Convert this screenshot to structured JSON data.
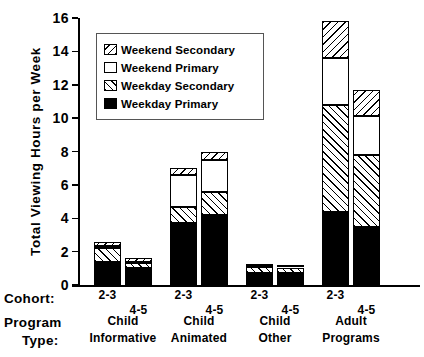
{
  "chart_data": {
    "type": "bar",
    "subtype": "stacked-grouped",
    "title": "",
    "xlabel": "",
    "ylabel": "Total Viewing Hours per Week",
    "ylim": [
      0,
      16
    ],
    "ytick_step": 2,
    "yticks": [
      "0",
      "2",
      "4",
      "6",
      "8",
      "10",
      "12",
      "14",
      "16"
    ],
    "grid": false,
    "legend_position": "upper-left-inside",
    "axis_row_labels": {
      "cohort_header": "Cohort:",
      "program_header_line1": "Program",
      "program_header_line2": "Type:"
    },
    "groups": [
      {
        "group_label_line1": "Child",
        "group_label_line2": "Informative",
        "bars": [
          {
            "cohort": "2-3",
            "total": 2.6,
            "segments": {
              "Weekday Primary": 1.4,
              "Weekday Secondary": 0.8,
              "Weekend Primary": 0.15,
              "Weekend Secondary": 0.25
            }
          },
          {
            "cohort": "4-5",
            "total": 1.6,
            "segments": {
              "Weekday Primary": 1.0,
              "Weekday Secondary": 0.3,
              "Weekend Primary": 0.1,
              "Weekend Secondary": 0.2
            }
          }
        ]
      },
      {
        "group_label_line1": "Child",
        "group_label_line2": "Animated",
        "bars": [
          {
            "cohort": "2-3",
            "total": 7.0,
            "segments": {
              "Weekday Primary": 3.7,
              "Weekday Secondary": 1.0,
              "Weekend Primary": 1.9,
              "Weekend Secondary": 0.4
            }
          },
          {
            "cohort": "4-5",
            "total": 8.0,
            "segments": {
              "Weekday Primary": 4.2,
              "Weekday Secondary": 1.4,
              "Weekend Primary": 1.9,
              "Weekend Secondary": 0.5
            }
          }
        ]
      },
      {
        "group_label_line1": "Child",
        "group_label_line2": "Other",
        "bars": [
          {
            "cohort": "2-3",
            "total": 1.2,
            "segments": {
              "Weekday Primary": 0.7,
              "Weekday Secondary": 0.4,
              "Weekend Primary": 0.05,
              "Weekend Secondary": 0.05
            }
          },
          {
            "cohort": "4-5",
            "total": 1.15,
            "segments": {
              "Weekday Primary": 0.7,
              "Weekday Secondary": 0.35,
              "Weekend Primary": 0.05,
              "Weekend Secondary": 0.05
            }
          }
        ]
      },
      {
        "group_label_line1": "Adult",
        "group_label_line2": "Programs",
        "bars": [
          {
            "cohort": "2-3",
            "total": 15.8,
            "segments": {
              "Weekday Primary": 4.4,
              "Weekday Secondary": 6.4,
              "Weekend Primary": 2.8,
              "Weekend Secondary": 2.2
            }
          },
          {
            "cohort": "4-5",
            "total": 11.7,
            "segments": {
              "Weekday Primary": 3.5,
              "Weekday Secondary": 4.3,
              "Weekend Primary": 2.3,
              "Weekend Secondary": 1.6
            }
          }
        ]
      }
    ],
    "legend": [
      {
        "label": "Weekend Secondary",
        "pattern": "backslash-hatch"
      },
      {
        "label": "Weekend Primary",
        "pattern": "solid-white"
      },
      {
        "label": "Weekday Secondary",
        "pattern": "forwardslash-hatch"
      },
      {
        "label": "Weekday Primary",
        "pattern": "solid-black"
      }
    ],
    "series_order_bottom_to_top": [
      "Weekday Primary",
      "Weekday Secondary",
      "Weekend Primary",
      "Weekend Secondary"
    ],
    "colors": {
      "ink": "#000000",
      "background": "#ffffff",
      "legend_border": "#555555"
    }
  }
}
